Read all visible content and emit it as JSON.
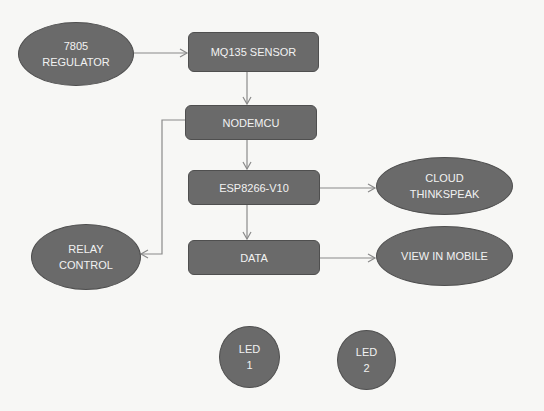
{
  "diagram": {
    "colors": {
      "node_fill": "#6a6a6a",
      "node_text": "#f2f2f2",
      "edge": "#8a8a8a",
      "background": "#f7f7f5"
    },
    "nodes": {
      "regulator": {
        "line1": "7805",
        "line2": "REGULATOR",
        "shape": "ellipse"
      },
      "sensor": {
        "label": "MQ135 SENSOR",
        "shape": "box"
      },
      "nodemcu": {
        "label": "NODEMCU",
        "shape": "box"
      },
      "esp": {
        "label": "ESP8266-V10",
        "shape": "box"
      },
      "data": {
        "label": "DATA",
        "shape": "box"
      },
      "cloud": {
        "line1": "CLOUD",
        "line2": "THINKSPEAK",
        "shape": "ellipse"
      },
      "mobile": {
        "label": "VIEW IN MOBILE",
        "shape": "ellipse"
      },
      "relay": {
        "line1": "RELAY",
        "line2": "CONTROL",
        "shape": "ellipse"
      },
      "led1": {
        "line1": "LED",
        "line2": "1",
        "shape": "circle"
      },
      "led2": {
        "line1": "LED",
        "line2": "2",
        "shape": "circle"
      }
    },
    "edges": [
      {
        "from": "7805 REGULATOR",
        "to": "MQ135 SENSOR"
      },
      {
        "from": "MQ135 SENSOR",
        "to": "NODEMCU"
      },
      {
        "from": "NODEMCU",
        "to": "ESP8266-V10"
      },
      {
        "from": "NODEMCU",
        "to": "RELAY CONTROL"
      },
      {
        "from": "ESP8266-V10",
        "to": "CLOUD THINKSPEAK"
      },
      {
        "from": "ESP8266-V10",
        "to": "DATA"
      },
      {
        "from": "DATA",
        "to": "VIEW IN MOBILE"
      }
    ]
  }
}
